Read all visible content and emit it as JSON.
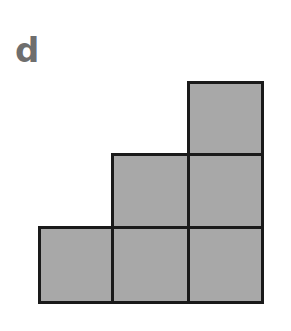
{
  "label": "d",
  "figure": {
    "fill_color": "#a8a8a8",
    "border_color": "#1a1a1a",
    "squares": [
      {
        "row": 0,
        "col": 2
      },
      {
        "row": 1,
        "col": 1
      },
      {
        "row": 1,
        "col": 2
      },
      {
        "row": 2,
        "col": 0
      },
      {
        "row": 2,
        "col": 1
      },
      {
        "row": 2,
        "col": 2
      }
    ],
    "square_count": 6
  }
}
